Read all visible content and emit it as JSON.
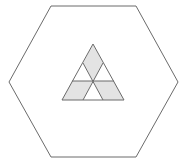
{
  "diagram": {
    "width": 188,
    "height": 160,
    "colors": {
      "background": "#ffffff",
      "stroke": "#6b6b6b",
      "shade": "#e3e3e3"
    },
    "hexagon": {
      "points": "51,6 136,6 178,82 136,157 51,157 9,82"
    },
    "triangle": {
      "outline": "93,44 62,100 124,100",
      "shaded_regions": [
        {
          "name": "top-rhombus",
          "points": "93,44 103,63 93,81 83,63"
        },
        {
          "name": "bottom-left-parallelogram",
          "points": "72,81 93,81 83,100 62,100"
        },
        {
          "name": "bottom-right-parallelogram",
          "points": "93,81 114,81 124,100 103,100"
        }
      ],
      "lines": [
        {
          "name": "horizontal-midline",
          "x1": 72,
          "y1": 81,
          "x2": 114,
          "y2": 81
        },
        {
          "name": "diagonal-left-to-right",
          "x1": 83,
          "y1": 63,
          "x2": 103,
          "y2": 100
        },
        {
          "name": "diagonal-right-to-left",
          "x1": 103,
          "y1": 63,
          "x2": 83,
          "y2": 100
        }
      ]
    }
  }
}
